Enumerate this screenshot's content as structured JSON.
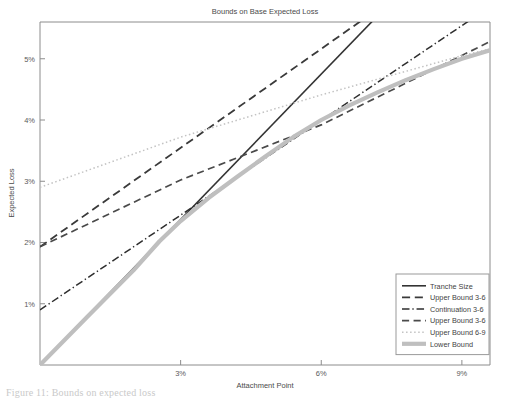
{
  "figure": {
    "title": "Bounds on Base Expected Loss",
    "caption": "Figure 11: Bounds on expected loss"
  },
  "chart_data": {
    "type": "line",
    "title": "Bounds on Base Expected Loss",
    "xlabel": "Attachment Point",
    "ylabel": "Expected Loss",
    "xlim": [
      0,
      9.6
    ],
    "ylim": [
      0,
      5.6
    ],
    "xtick_values": [
      3,
      6,
      9
    ],
    "xtick_labels": [
      "3%",
      "6%",
      "9%"
    ],
    "ytick_values": [
      1,
      2,
      3,
      4,
      5
    ],
    "ytick_labels": [
      "1%",
      "2%",
      "3%",
      "4%",
      "5%"
    ],
    "grid": false,
    "legend_position": "lower right",
    "series": [
      {
        "name": "Tranche Size",
        "style": "solid",
        "color": "#333333",
        "width": 1.6,
        "points": [
          [
            0,
            0
          ],
          [
            9.6,
            7.6
          ]
        ]
      },
      {
        "name": "Upper Bound 3-6",
        "style": "dashed-long",
        "color": "#3a3a3a",
        "width": 1.8,
        "points": [
          [
            0,
            1.93
          ],
          [
            9.6,
            7.1
          ]
        ]
      },
      {
        "name": "Continuation 3-6",
        "style": "dashdot",
        "color": "#2e2e2e",
        "width": 1.5,
        "points": [
          [
            0,
            0.9
          ],
          [
            9.6,
            5.85
          ]
        ]
      },
      {
        "name": "Upper Bound 3-6",
        "style": "dashed",
        "color": "#4a4a4a",
        "width": 1.7,
        "points": [
          [
            0,
            1.93
          ],
          [
            3.0,
            3.02
          ],
          [
            6.0,
            3.92
          ],
          [
            9.6,
            5.28
          ]
        ]
      },
      {
        "name": "Upper Bound 6-9",
        "style": "dotted",
        "color": "#c3c3c3",
        "width": 1.5,
        "points": [
          [
            0,
            2.9
          ],
          [
            3.0,
            3.72
          ],
          [
            6.0,
            4.41
          ],
          [
            9.0,
            5.05
          ],
          [
            9.6,
            5.16
          ]
        ]
      },
      {
        "name": "Lower Bound",
        "style": "solid",
        "color": "#bfbfbf",
        "width": 4.2,
        "points": [
          [
            0,
            0
          ],
          [
            1.0,
            0.78
          ],
          [
            2.0,
            1.55
          ],
          [
            2.55,
            2.02
          ],
          [
            3.0,
            2.35
          ],
          [
            3.6,
            2.73
          ],
          [
            4.2,
            3.07
          ],
          [
            4.8,
            3.4
          ],
          [
            5.4,
            3.72
          ],
          [
            6.0,
            4.0
          ],
          [
            6.6,
            4.24
          ],
          [
            7.2,
            4.45
          ],
          [
            7.8,
            4.65
          ],
          [
            8.4,
            4.83
          ],
          [
            9.0,
            5.0
          ],
          [
            9.6,
            5.14
          ]
        ]
      }
    ],
    "legend_entries": [
      {
        "label": "Tranche Size",
        "style": "solid",
        "color": "#333333",
        "width": 1.6
      },
      {
        "label": "Upper Bound 3-6",
        "style": "dashed-long",
        "color": "#3a3a3a",
        "width": 1.8
      },
      {
        "label": "Continuation 3-6",
        "style": "dashdot",
        "color": "#2e2e2e",
        "width": 1.5
      },
      {
        "label": "Upper Bound 3-6",
        "style": "dashed",
        "color": "#4a4a4a",
        "width": 1.7
      },
      {
        "label": "Upper Bound 6-9",
        "style": "dotted",
        "color": "#c3c3c3",
        "width": 1.5
      },
      {
        "label": "Lower Bound",
        "style": "solid",
        "color": "#bfbfbf",
        "width": 4.2
      }
    ]
  }
}
